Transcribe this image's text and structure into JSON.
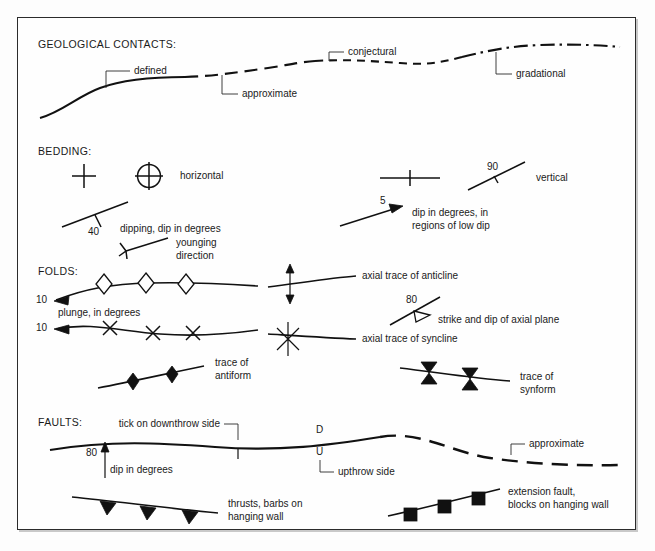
{
  "figure": {
    "background": "#fdfdfd",
    "border_color": "#2b2b2b",
    "ink_color": "#111111"
  },
  "sections": {
    "contacts": {
      "heading": "GEOLOGICAL CONTACTS:",
      "labels": {
        "defined": "defined",
        "approximate": "approximate",
        "conjectural": "conjectural",
        "gradational": "gradational"
      }
    },
    "bedding": {
      "heading": "BEDDING:",
      "labels": {
        "horizontal": "horizontal",
        "dipping": "dipping, dip in degrees",
        "younging_line1": "younging",
        "younging_line2": "direction",
        "vertical": "vertical",
        "lowdip_line1": "dip in degrees, in",
        "lowdip_line2": "regions of low dip"
      },
      "values": {
        "dip_40": "40",
        "dip_90": "90",
        "dip_5": "5"
      }
    },
    "folds": {
      "heading": "FOLDS:",
      "labels": {
        "plunge": "plunge, in degrees",
        "axial_anticline": "axial trace of anticline",
        "axial_syncline": "axial trace of syncline",
        "strike_dip_axial": "strike and dip of axial plane",
        "antiform_line1": "trace of",
        "antiform_line2": "antiform",
        "synform_line1": "trace of",
        "synform_line2": "synform"
      },
      "values": {
        "plunge_anticline": "10",
        "plunge_syncline": "10",
        "axial_dip_80": "80"
      }
    },
    "faults": {
      "heading": "FAULTS:",
      "labels": {
        "tick_downthrow": "tick on downthrow side",
        "dip_in_degrees": "dip in degrees",
        "upthrow_side": "upthrow side",
        "approximate": "approximate",
        "thrust_line1": "thrusts, barbs on",
        "thrust_line2": "hanging wall",
        "extension_line1": "extension fault,",
        "extension_line2": "blocks on hanging wall"
      },
      "values": {
        "dip_80": "80",
        "downthrow_marker": "D",
        "upthrow_marker": "U"
      }
    }
  }
}
